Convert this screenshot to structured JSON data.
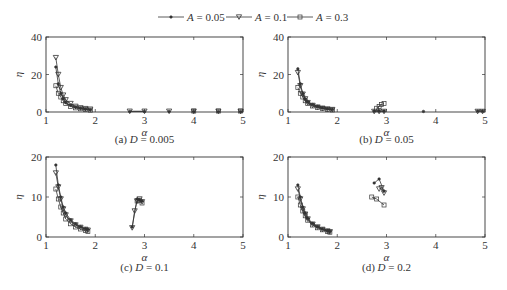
{
  "chart_data": {
    "legend": [
      {
        "label": "A = 0.05",
        "marker": "dot"
      },
      {
        "label": "A = 0.1",
        "marker": "triangle-down"
      },
      {
        "label": "A = 0.3",
        "marker": "square"
      }
    ],
    "legend_position": "top-center",
    "panels": [
      {
        "id": "a",
        "type": "line",
        "caption": "(a) D = 0.005",
        "xlabel": "α",
        "ylabel": "η",
        "xlim": [
          1,
          5
        ],
        "ylim": [
          0,
          40
        ],
        "xticks": [
          1,
          2,
          3,
          4,
          5
        ],
        "yticks": [
          0,
          20,
          40
        ],
        "grid": false,
        "series": [
          {
            "name": "A = 0.05",
            "points": [
              [
                1.2,
                24
              ],
              [
                1.25,
                15
              ],
              [
                1.3,
                10
              ],
              [
                1.35,
                7
              ],
              [
                1.4,
                5
              ],
              [
                1.5,
                3.5
              ],
              [
                1.6,
                2.5
              ],
              [
                1.7,
                2
              ],
              [
                1.8,
                1.5
              ],
              [
                1.9,
                1.2
              ],
              [
                2.7,
                0.3
              ],
              [
                3,
                0.3
              ],
              [
                3.5,
                0.3
              ],
              [
                4,
                0.3
              ],
              [
                4.5,
                0.3
              ],
              [
                4.95,
                0.3
              ]
            ]
          },
          {
            "name": "A = 0.1",
            "points": [
              [
                1.2,
                29
              ],
              [
                1.25,
                20
              ],
              [
                1.3,
                13
              ],
              [
                1.35,
                9
              ],
              [
                1.4,
                6.5
              ],
              [
                1.5,
                4.5
              ],
              [
                1.6,
                3
              ],
              [
                1.7,
                2.2
              ],
              [
                1.8,
                1.8
              ],
              [
                1.9,
                1.5
              ],
              [
                2.7,
                0.4
              ],
              [
                3,
                0.4
              ],
              [
                3.5,
                0.4
              ],
              [
                4,
                0.4
              ],
              [
                4.5,
                0.4
              ],
              [
                4.95,
                0.4
              ]
            ]
          },
          {
            "name": "A = 0.3",
            "points": [
              [
                1.2,
                14
              ],
              [
                1.25,
                10
              ],
              [
                1.3,
                8
              ],
              [
                1.35,
                6
              ],
              [
                1.4,
                4.5
              ],
              [
                1.5,
                3
              ],
              [
                1.6,
                2.2
              ],
              [
                1.7,
                1.7
              ],
              [
                1.8,
                1.3
              ],
              [
                1.9,
                1
              ],
              [
                4,
                0.5
              ],
              [
                4.5,
                0.5
              ],
              [
                4.95,
                0.5
              ]
            ]
          }
        ]
      },
      {
        "id": "b",
        "type": "line",
        "caption": "(b) D = 0.05",
        "xlabel": "α",
        "ylabel": "η",
        "xlim": [
          1,
          5
        ],
        "ylim": [
          0,
          40
        ],
        "xticks": [
          1,
          2,
          3,
          4,
          5
        ],
        "yticks": [
          0,
          20,
          40
        ],
        "grid": false,
        "series": [
          {
            "name": "A = 0.05",
            "points": [
              [
                1.2,
                23
              ],
              [
                1.25,
                15
              ],
              [
                1.3,
                10
              ],
              [
                1.35,
                7
              ],
              [
                1.4,
                5.5
              ],
              [
                1.5,
                4
              ],
              [
                1.6,
                3
              ],
              [
                1.7,
                2.3
              ],
              [
                1.8,
                1.8
              ],
              [
                1.9,
                1.4
              ],
              [
                2.75,
                0.5
              ],
              [
                2.85,
                0.5
              ],
              [
                2.95,
                0.5
              ],
              [
                3.75,
                0.3
              ],
              [
                4.85,
                0.5
              ],
              [
                4.95,
                0.6
              ]
            ]
          },
          {
            "name": "A = 0.1",
            "points": [
              [
                1.2,
                21
              ],
              [
                1.25,
                14
              ],
              [
                1.3,
                9.5
              ],
              [
                1.35,
                7
              ],
              [
                1.4,
                5
              ],
              [
                1.5,
                3.5
              ],
              [
                1.6,
                2.6
              ],
              [
                1.7,
                2
              ],
              [
                1.8,
                1.6
              ],
              [
                1.9,
                1.3
              ],
              [
                2.75,
                0.3
              ],
              [
                2.85,
                0.3
              ],
              [
                2.95,
                0.3
              ],
              [
                4.85,
                0.3
              ],
              [
                4.95,
                0.3
              ]
            ]
          },
          {
            "name": "A = 0.3",
            "points": [
              [
                1.2,
                13
              ],
              [
                1.25,
                10
              ],
              [
                1.3,
                8
              ],
              [
                1.35,
                6
              ],
              [
                1.4,
                4.5
              ],
              [
                1.5,
                3.2
              ],
              [
                1.6,
                2.4
              ],
              [
                1.7,
                1.8
              ],
              [
                1.8,
                1.4
              ],
              [
                1.9,
                1.1
              ],
              [
                2.8,
                2
              ],
              [
                2.85,
                3
              ],
              [
                2.9,
                4
              ],
              [
                2.95,
                4.5
              ]
            ]
          }
        ]
      },
      {
        "id": "c",
        "type": "line",
        "caption": "(c) D = 0.1",
        "xlabel": "α",
        "ylabel": "η",
        "xlim": [
          1,
          5
        ],
        "ylim": [
          0,
          20
        ],
        "xticks": [
          1,
          2,
          3,
          4,
          5
        ],
        "yticks": [
          0,
          10,
          20
        ],
        "grid": false,
        "series": [
          {
            "name": "A = 0.05",
            "points": [
              [
                1.2,
                18
              ],
              [
                1.25,
                13
              ],
              [
                1.3,
                10
              ],
              [
                1.35,
                7.5
              ],
              [
                1.4,
                6
              ],
              [
                1.5,
                4.3
              ],
              [
                1.6,
                3.3
              ],
              [
                1.7,
                2.6
              ],
              [
                1.8,
                2.1
              ],
              [
                1.85,
                1.9
              ],
              [
                2.75,
                2.5
              ],
              [
                2.85,
                9.5
              ],
              [
                2.9,
                9.3
              ],
              [
                2.95,
                9
              ]
            ]
          },
          {
            "name": "A = 0.1",
            "points": [
              [
                1.2,
                16
              ],
              [
                1.25,
                12.5
              ],
              [
                1.3,
                9.5
              ],
              [
                1.35,
                7
              ],
              [
                1.4,
                5.5
              ],
              [
                1.5,
                4
              ],
              [
                1.6,
                3
              ],
              [
                1.7,
                2.4
              ],
              [
                1.8,
                1.9
              ],
              [
                1.85,
                1.7
              ],
              [
                2.75,
                2.3
              ],
              [
                2.8,
                6.5
              ],
              [
                2.85,
                9
              ],
              [
                2.9,
                9.5
              ],
              [
                2.95,
                8.8
              ]
            ]
          },
          {
            "name": "A = 0.3",
            "points": [
              [
                1.2,
                12
              ],
              [
                1.25,
                9.5
              ],
              [
                1.3,
                7.5
              ],
              [
                1.35,
                6
              ],
              [
                1.4,
                4.5
              ],
              [
                1.5,
                3.3
              ],
              [
                1.6,
                2.5
              ],
              [
                1.7,
                2
              ],
              [
                1.8,
                1.6
              ],
              [
                1.85,
                1.4
              ],
              [
                2.85,
                9
              ],
              [
                2.9,
                9.2
              ],
              [
                2.95,
                8.5
              ]
            ]
          }
        ]
      },
      {
        "id": "d",
        "type": "line",
        "caption": "(d) D = 0.2",
        "xlabel": "α",
        "ylabel": "η",
        "xlim": [
          1,
          5
        ],
        "ylim": [
          0,
          20
        ],
        "xticks": [
          1,
          2,
          3,
          4,
          5
        ],
        "yticks": [
          0,
          10,
          20
        ],
        "grid": false,
        "series": [
          {
            "name": "A = 0.05",
            "points": [
              [
                1.2,
                13
              ],
              [
                1.25,
                10
              ],
              [
                1.3,
                7.5
              ],
              [
                1.35,
                6
              ],
              [
                1.4,
                4.7
              ],
              [
                1.5,
                3.4
              ],
              [
                1.6,
                2.6
              ],
              [
                1.7,
                2
              ],
              [
                1.8,
                1.6
              ],
              [
                1.85,
                1.4
              ],
              [
                2.75,
                13.5
              ],
              [
                2.85,
                14.5
              ],
              [
                2.95,
                11.5
              ]
            ]
          },
          {
            "name": "A = 0.1",
            "points": [
              [
                1.2,
                12
              ],
              [
                1.25,
                9.5
              ],
              [
                1.3,
                7
              ],
              [
                1.35,
                5.7
              ],
              [
                1.4,
                4.5
              ],
              [
                1.5,
                3.2
              ],
              [
                1.6,
                2.5
              ],
              [
                1.7,
                1.9
              ],
              [
                1.8,
                1.5
              ],
              [
                1.85,
                1.3
              ],
              [
                2.85,
                12
              ],
              [
                2.9,
                12.3
              ],
              [
                2.95,
                11
              ]
            ]
          },
          {
            "name": "A = 0.3",
            "points": [
              [
                1.2,
                10
              ],
              [
                1.25,
                8
              ],
              [
                1.3,
                6.5
              ],
              [
                1.35,
                5.3
              ],
              [
                1.4,
                4.2
              ],
              [
                1.5,
                3
              ],
              [
                1.6,
                2.3
              ],
              [
                1.7,
                1.8
              ],
              [
                1.8,
                1.4
              ],
              [
                1.85,
                1.2
              ],
              [
                2.7,
                10
              ],
              [
                2.8,
                9.5
              ],
              [
                2.95,
                8
              ]
            ]
          }
        ]
      }
    ]
  }
}
